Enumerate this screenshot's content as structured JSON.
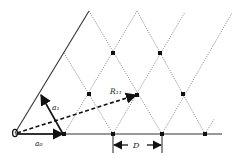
{
  "diagram": {
    "labels": {
      "origin": "O",
      "vector_a0": "a₀",
      "vector_a1": "a₁",
      "vector_r11": "R₁₁",
      "spacing": "D"
    },
    "colors": {
      "line": "#222222",
      "dotted": "#8a8a8a",
      "point": "#111111"
    },
    "lattice_points": [
      {
        "x": 64,
        "y": 134
      },
      {
        "x": 113,
        "y": 134
      },
      {
        "x": 162,
        "y": 134
      },
      {
        "x": 205,
        "y": 134
      },
      {
        "x": 89,
        "y": 94
      },
      {
        "x": 137,
        "y": 95
      },
      {
        "x": 183,
        "y": 94
      },
      {
        "x": 113,
        "y": 53
      },
      {
        "x": 160,
        "y": 53
      }
    ]
  }
}
